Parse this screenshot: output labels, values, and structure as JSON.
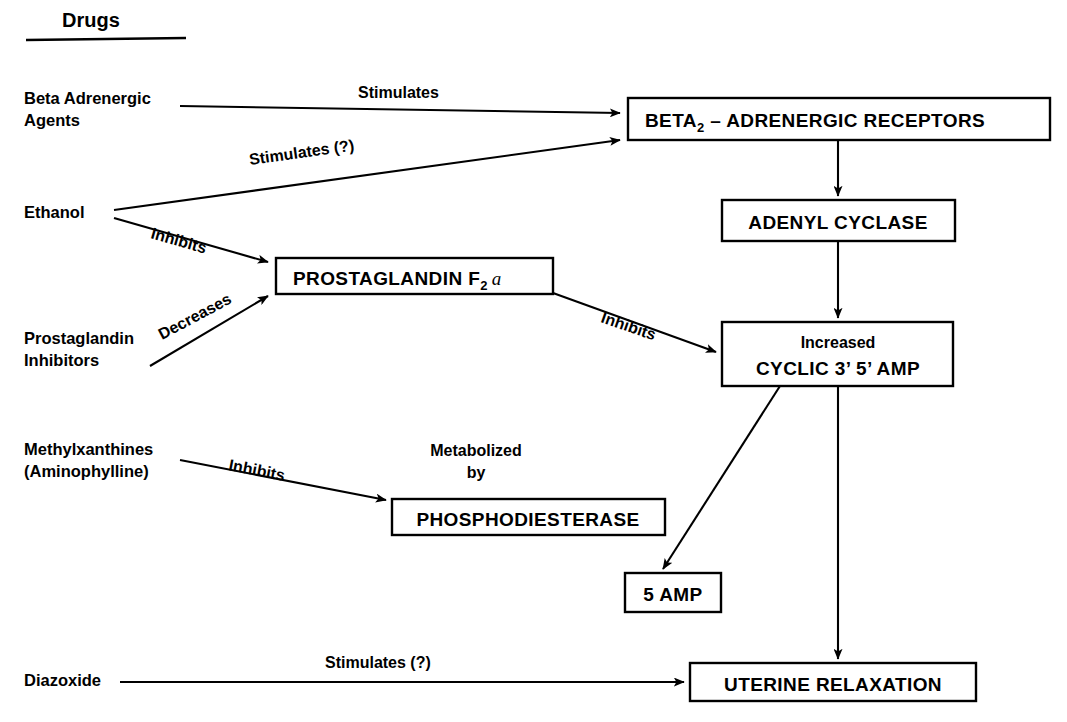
{
  "figure": {
    "heading": "Drugs",
    "background_color": "#ffffff",
    "line_color": "#000000"
  },
  "drugs": [
    {
      "id": "beta-adrenergic-agents",
      "line1": "Beta Adrenergic",
      "line2": "Agents"
    },
    {
      "id": "ethanol",
      "line1": "Ethanol",
      "line2": ""
    },
    {
      "id": "prostaglandin-inhibitors",
      "line1": "Prostaglandin",
      "line2": "Inhibitors"
    },
    {
      "id": "methylxanthines",
      "line1": "Methylxanthines",
      "line2": "(Aminophylline)"
    },
    {
      "id": "diazoxide",
      "line1": "Diazoxide",
      "line2": ""
    }
  ],
  "nodes": [
    {
      "id": "beta2-adrenergic-receptors",
      "line1": "BETA",
      "subscript": "2",
      "line1b": " – ADRENERGIC RECEPTORS",
      "line2": ""
    },
    {
      "id": "adenyl-cyclase",
      "line1": "ADENYL CYCLASE",
      "line2": ""
    },
    {
      "id": "prostaglandin-f2a",
      "line1": "PROSTAGLANDIN F",
      "subscript": "2",
      "alpha": "a",
      "line2": ""
    },
    {
      "id": "cyclic-amp",
      "line1": "Increased",
      "line2": "CYCLIC 3’ 5’ AMP"
    },
    {
      "id": "phosphodiesterase",
      "line1": "PHOSPHODIESTERASE",
      "line2": ""
    },
    {
      "id": "five-amp",
      "line1": "5 AMP",
      "line2": ""
    },
    {
      "id": "uterine-relaxation",
      "line1": "UTERINE RELAXATION",
      "line2": ""
    }
  ],
  "edges": [
    {
      "id": "beta-agents-to-receptors",
      "label": "Stimulates",
      "from": "beta-adrenergic-agents",
      "to": "beta2-adrenergic-receptors"
    },
    {
      "id": "ethanol-to-receptors",
      "label": "Stimulates (?)",
      "from": "ethanol",
      "to": "beta2-adrenergic-receptors"
    },
    {
      "id": "ethanol-to-prostaglandin",
      "label": "Inhibits",
      "from": "ethanol",
      "to": "prostaglandin-f2a"
    },
    {
      "id": "pg-inhibitors-to-prostaglandin",
      "label": "Decreases",
      "from": "prostaglandin-inhibitors",
      "to": "prostaglandin-f2a"
    },
    {
      "id": "prostaglandin-to-cyclic-amp",
      "label": "Inhibits",
      "from": "prostaglandin-f2a",
      "to": "cyclic-amp"
    },
    {
      "id": "methylxanthines-to-phosphodiesterase",
      "label": "Inhibits",
      "from": "methylxanthines",
      "to": "phosphodiesterase"
    },
    {
      "id": "phosphodiesterase-metabolizes",
      "label_line1": "Metabolized",
      "label_line2": "by",
      "from": "phosphodiesterase",
      "to": "cyclic-amp"
    },
    {
      "id": "receptors-to-adenyl-cyclase",
      "label": "",
      "from": "beta2-adrenergic-receptors",
      "to": "adenyl-cyclase"
    },
    {
      "id": "adenyl-cyclase-to-cyclic-amp",
      "label": "",
      "from": "adenyl-cyclase",
      "to": "cyclic-amp"
    },
    {
      "id": "cyclic-amp-to-five-amp",
      "label": "",
      "from": "cyclic-amp",
      "to": "five-amp"
    },
    {
      "id": "cyclic-amp-to-uterine-relaxation",
      "label": "",
      "from": "cyclic-amp",
      "to": "uterine-relaxation"
    },
    {
      "id": "diazoxide-to-uterine-relaxation",
      "label": "Stimulates (?)",
      "from": "diazoxide",
      "to": "uterine-relaxation"
    }
  ]
}
